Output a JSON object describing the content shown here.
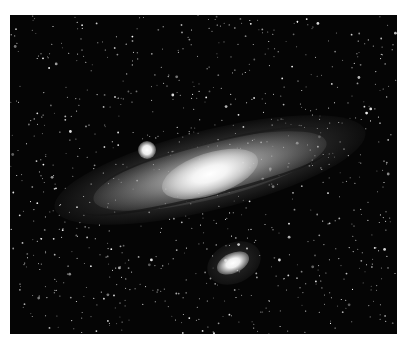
{
  "image": {
    "subject": "Andromeda Galaxy (spiral galaxy) with two satellite galaxies against a star field",
    "style": "monochrome astronomical photograph",
    "colors": {
      "background": "#ffffff",
      "sky": "#050505",
      "core": "#ffffff",
      "disk": "#b4b4b4"
    },
    "elements": [
      {
        "name": "galaxy-core",
        "description": "bright elongated central bulge"
      },
      {
        "name": "spiral-disk",
        "description": "tilted disk with dark dust lanes"
      },
      {
        "name": "satellite-galaxy-upper",
        "description": "small round bright companion upper-left of core"
      },
      {
        "name": "satellite-galaxy-lower",
        "description": "elliptical bright companion below the disk"
      },
      {
        "name": "star-field",
        "description": "dense scattering of white point stars"
      }
    ]
  }
}
